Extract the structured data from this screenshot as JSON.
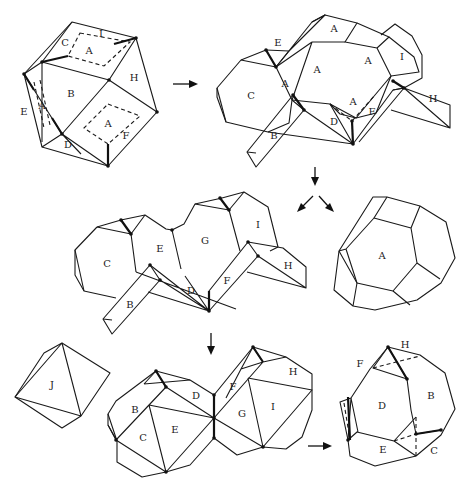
{
  "figure": {
    "panels": {
      "p1_folded": {
        "labels": [
          "C",
          "A",
          "I",
          "B",
          "H",
          "E",
          "A",
          "A",
          "F",
          "D"
        ]
      },
      "p2_unfolded_strip": {
        "labels": [
          "E",
          "A",
          "A",
          "A",
          "I",
          "C",
          "A",
          "A",
          "H",
          "F",
          "D",
          "B"
        ]
      },
      "p3_net": {
        "labels": [
          "C",
          "E",
          "G",
          "I",
          "H",
          "B",
          "D",
          "F"
        ]
      },
      "p4_solid_A": {
        "labels": [
          "A"
        ]
      },
      "p5_octahedron_J": {
        "labels": [
          "J"
        ]
      },
      "p6_two_pieces": {
        "labels": [
          "B",
          "D",
          "F",
          "H",
          "C",
          "E",
          "G",
          "I"
        ]
      },
      "p7_refolded": {
        "labels": [
          "F",
          "H",
          "D",
          "B",
          "E",
          "C"
        ]
      }
    },
    "arrows": [
      {
        "from": "p1_folded",
        "to": "p2_unfolded_strip",
        "direction": "right"
      },
      {
        "from": "p2_unfolded_strip",
        "to": "split",
        "direction": "down"
      },
      {
        "from": "split",
        "to": "p3_net",
        "direction": "down-left"
      },
      {
        "from": "split",
        "to": "p4_solid_A",
        "direction": "down-right"
      },
      {
        "from": "p3_net",
        "to": "p6_two_pieces",
        "direction": "down"
      },
      {
        "from": "p6_two_pieces",
        "to": "p7_refolded",
        "direction": "right"
      }
    ],
    "caption_visible": false
  }
}
